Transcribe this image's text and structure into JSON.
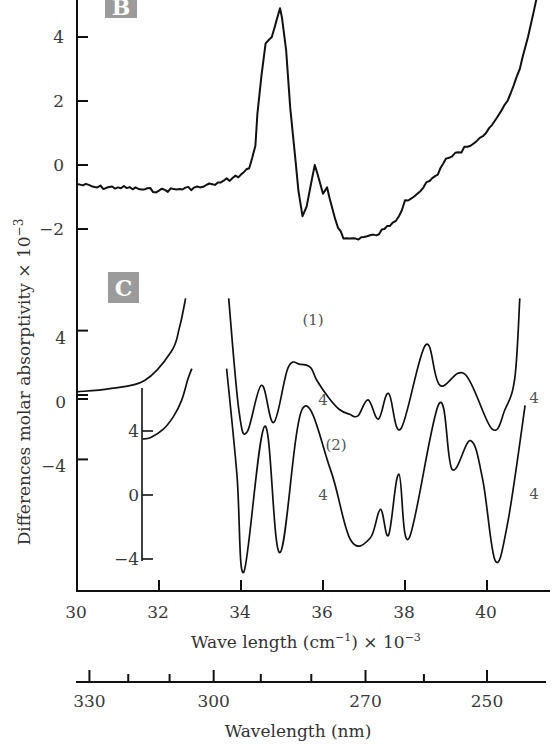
{
  "chart_data": [
    {
      "panel": "B",
      "type": "line",
      "title": "",
      "xlabel": "Wave length (cm⁻¹) × 10⁻³",
      "ylabel": "Differences molar absorptivity × 10⁻³",
      "xlim": [
        30,
        41.5
      ],
      "ylim": [
        -2.5,
        5.2
      ],
      "yticks": [
        4,
        2,
        0,
        -2
      ],
      "ytick_labels": [
        "4",
        "2",
        "0",
        "−2"
      ],
      "grid": false,
      "series": [
        {
          "name": "B",
          "x": [
            30.0,
            30.5,
            31.0,
            31.5,
            32.0,
            32.5,
            33.0,
            33.3,
            33.5,
            33.8,
            34.0,
            34.2,
            34.35,
            34.4,
            34.5,
            34.6,
            34.75,
            34.95,
            35.0,
            35.1,
            35.2,
            35.4,
            35.5,
            35.6,
            35.8,
            36.0,
            36.1,
            36.3,
            36.5,
            36.8,
            37.0,
            37.3,
            37.5,
            37.7,
            37.85,
            38.0,
            38.3,
            38.6,
            38.8,
            39.0,
            39.3,
            39.6,
            39.9,
            40.2,
            40.5,
            40.8,
            41.0,
            41.2
          ],
          "y": [
            -0.6,
            -0.7,
            -0.7,
            -0.75,
            -0.8,
            -0.75,
            -0.7,
            -0.6,
            -0.55,
            -0.4,
            -0.3,
            -0.1,
            0.6,
            1.6,
            2.8,
            3.8,
            4.0,
            4.9,
            4.6,
            3.6,
            1.8,
            -0.8,
            -1.6,
            -1.3,
            0.0,
            -0.9,
            -0.7,
            -1.7,
            -2.3,
            -2.3,
            -2.25,
            -2.2,
            -2.0,
            -1.8,
            -1.6,
            -1.1,
            -0.9,
            -0.5,
            -0.3,
            0.2,
            0.4,
            0.6,
            0.9,
            1.4,
            2.0,
            3.0,
            4.0,
            5.2
          ]
        }
      ]
    },
    {
      "panel": "C",
      "type": "line",
      "xlabel": "Wave length (cm⁻¹) × 10⁻³",
      "ylabel": "Differences molar absorptivity × 10⁻³",
      "xlim": [
        30,
        41.5
      ],
      "ylim_main": [
        -6,
        6
      ],
      "yticks_main": [
        4,
        0,
        -4
      ],
      "ytick_labels_main": [
        "4",
        "0",
        "−4"
      ],
      "yticks_inset": [
        4,
        0,
        -4
      ],
      "ytick_labels_inset": [
        "4",
        "0",
        "−4"
      ],
      "xticks": [
        30,
        32,
        34,
        36,
        38,
        40
      ],
      "xtick_labels": [
        "30",
        "32",
        "34",
        "36",
        "38",
        "40"
      ],
      "annotations": [
        "(1)",
        "(2)",
        "4",
        "4",
        "4",
        "4"
      ],
      "series": [
        {
          "name": "(1)",
          "axis": "main",
          "x": [
            30.0,
            30.8,
            31.65,
            32.3,
            32.5,
            32.65,
            33.7,
            33.95,
            34.15,
            34.5,
            34.8,
            35.15,
            35.45,
            35.7,
            35.85,
            36.15,
            36.4,
            36.65,
            36.85,
            37.1,
            37.35,
            37.6,
            37.9,
            38.5,
            38.85,
            39.46,
            40.12,
            40.44,
            40.68,
            40.8
          ],
          "y": [
            0.2,
            0.4,
            0.9,
            2.7,
            4.2,
            6.0,
            6.0,
            -1.0,
            -2.3,
            0.6,
            -1.7,
            1.7,
            1.9,
            1.7,
            0.9,
            -0.2,
            -0.9,
            -1.2,
            -1.3,
            -0.3,
            -1.5,
            0.1,
            -2.1,
            3.1,
            0.6,
            1.3,
            -2.1,
            -0.9,
            1.1,
            6.0
          ]
        },
        {
          "name": "(2)",
          "axis": "inset",
          "x": [
            31.6,
            31.8,
            32.1,
            32.35,
            32.55,
            32.7,
            32.8,
            33.65,
            33.9,
            34.07,
            34.58,
            34.95,
            35.5,
            36.18,
            36.67,
            37.15,
            37.4,
            37.6,
            37.85,
            38.1,
            38.83,
            39.15,
            39.6,
            39.9,
            40.2,
            40.5,
            40.93
          ],
          "y": [
            3.5,
            3.6,
            4.1,
            4.9,
            5.9,
            7.2,
            7.9,
            7.9,
            1.3,
            -4.8,
            4.3,
            -3.6,
            5.4,
            1.6,
            -2.8,
            -2.7,
            -0.9,
            -2.5,
            1.3,
            -2.7,
            5.7,
            1.6,
            3.4,
            0.9,
            -4.1,
            -1.8,
            5.6
          ]
        }
      ],
      "xaxis2": {
        "label": "Wavelength (nm)",
        "major_ticks": [
          330,
          300,
          270,
          250
        ],
        "major_tick_labels": [
          "330",
          "300",
          "270",
          "250"
        ]
      }
    }
  ],
  "labels": {
    "panel_b": "B",
    "panel_c": "C",
    "ylabel": "Differences molar absorptivity × 10",
    "ylabel_exp": "−3",
    "xlabel_main": "Wave length (cm",
    "xlabel_sup1": "−1",
    "xlabel_mid": ") × 10",
    "xlabel_sup2": "−3",
    "xlabel_nm": "Wavelength (nm)",
    "curve1": "(1)",
    "curve2": "(2)",
    "scale_mark": "4"
  }
}
